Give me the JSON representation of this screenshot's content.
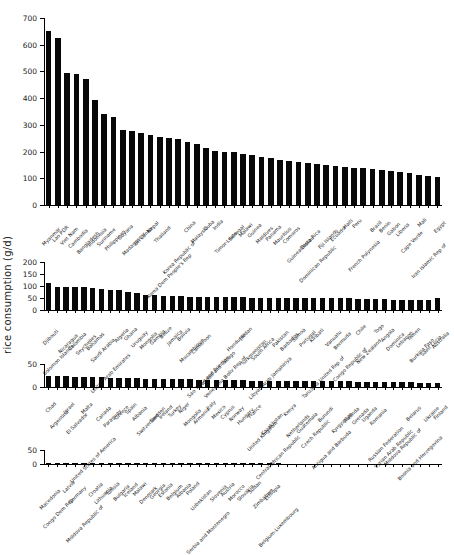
{
  "chart_data": {
    "type": "bar",
    "title": "",
    "xlabel": "",
    "ylabel": "rice consumption (g/d)",
    "grid": false,
    "legend": "none",
    "orientation": "vertical",
    "bar_color": "#080808",
    "note": "Four stacked panels, countries sorted descending by rice consumption (g/d)",
    "panels": [
      {
        "index": 1,
        "ylim": [
          0,
          700
        ],
        "yticks": [
          0,
          100,
          200,
          300,
          400,
          500,
          600,
          700
        ],
        "categories": [
          "Myanmar",
          "Lao PDR",
          "Viet Nam",
          "Cambodia",
          "Bangladesh",
          "Indonesia",
          "Suriname",
          "Philippines",
          "Guyana",
          "Madagascar",
          "Sri Lanka",
          "Nepal",
          "Thailand",
          "Korea Dem People's Rep",
          "Korea Republic of",
          "China",
          "Malaysia",
          "Cuba",
          "India",
          "Timor-Leste",
          "Senegal",
          "Malawi",
          "Guinea",
          "Maldives",
          "Panama",
          "Mauritius",
          "Comoros",
          "Guinea-Bissau",
          "Costa Rica",
          "Dominican Republic",
          "Fiji Islands",
          "Ecuador",
          "Haiti",
          "Peru",
          "French Polynesia",
          "Brazil",
          "Benin",
          "Gabon",
          "Liberia",
          "Cape Verde",
          "Mali",
          "Iran Islamic Rep of",
          "Egypt"
        ],
        "values": [
          650,
          625,
          495,
          492,
          470,
          393,
          340,
          328,
          280,
          278,
          269,
          262,
          253,
          251,
          246,
          236,
          227,
          212,
          203,
          198,
          198,
          190,
          186,
          180,
          176,
          170,
          166,
          162,
          158,
          154,
          150,
          147,
          143,
          140,
          137,
          133,
          130,
          126,
          122,
          118,
          113,
          107,
          103
        ]
      },
      {
        "index": 2,
        "ylim": [
          0,
          200
        ],
        "yticks": [
          0,
          50,
          100,
          150,
          200
        ],
        "categories": [
          "Djibouti",
          "Solomon Islands",
          "Nicaragua",
          "Colombia",
          "Seychelles",
          "Bahamas",
          "Saudi Arabia",
          "United Arab Emirates",
          "Algeria",
          "Ghana",
          "Uruguay",
          "Mongolia",
          "Gambia",
          "Belize",
          "Jamaica",
          "Bolivia",
          "Mozambique",
          "Cameroon",
          "Sao Tome and Principe",
          "Trinidad and Tobago",
          "Venezuela Boliv Rep of",
          "Honduras",
          "Jordan",
          "Turkmenistan",
          "South Africa",
          "Libyan Arab Jamahiriya",
          "Pakistan",
          "Barbados",
          "Samoa",
          "Portugal",
          "Kiribati",
          "Tanzania United Rep of",
          "Vanuatu",
          "Bermuda",
          "Congo Republic of",
          "Chile",
          "New Zealand",
          "Togo",
          "Angola",
          "Dominica",
          "Lebanon",
          "Yemen",
          "Burkina Faso",
          "Saint Lucia",
          "Australia"
        ],
        "values": [
          112,
          97,
          96,
          95,
          95,
          93,
          87,
          85,
          85,
          75,
          72,
          63,
          62,
          58,
          57,
          57,
          56,
          54,
          53,
          53,
          53,
          53,
          53,
          52,
          52,
          52,
          52,
          51,
          51,
          50,
          50,
          49,
          49,
          48,
          48,
          47,
          46,
          45,
          44,
          43,
          42,
          41,
          40,
          40,
          48
        ]
      },
      {
        "index": 3,
        "ylim": [
          0,
          50
        ],
        "yticks": [
          0,
          50
        ],
        "categories": [
          "Chad",
          "Argentina",
          "Israel",
          "El Salvador",
          "Malta",
          "United States of America",
          "Canada",
          "Paraguay",
          "Greece",
          "Spain",
          "Albania",
          "Switzerland",
          "Sweden",
          "Ireland",
          "Turkey",
          "Niger",
          "Mongolia",
          "Armenia",
          "Italy",
          "Mexico",
          "Cyprus",
          "Norway",
          "Hungary",
          "France",
          "United Kingdom",
          "Kazakhstan",
          "Central African Republic",
          "Kenya",
          "Netherlands",
          "Guatemala",
          "Czech Republic",
          "Burundi",
          "Antigua and Barbuda",
          "Kyrgyzstan",
          "Rwanda",
          "Grenada",
          "Uganda",
          "Romania",
          "Russian Federation",
          "Syrian Arab Republic",
          "Moldova Republic of",
          "Belarus",
          "Bosnia and Herzegovina",
          "Ukraine",
          "Finland"
        ],
        "values": [
          24,
          23,
          23,
          22,
          22,
          21,
          21,
          20,
          20,
          19,
          19,
          18,
          18,
          18,
          17,
          17,
          17,
          16,
          16,
          16,
          15,
          15,
          15,
          14,
          14,
          14,
          14,
          13,
          13,
          13,
          13,
          12,
          12,
          12,
          12,
          11,
          11,
          11,
          11,
          10,
          10,
          10,
          9,
          9,
          9
        ]
      },
      {
        "index": 4,
        "ylim": [
          0,
          50
        ],
        "yticks": [
          0,
          50
        ],
        "categories": [
          "Macedonia",
          "Congo Dem Rep",
          "Latvia",
          "Germany",
          "Moldova Republic of",
          "Croatia",
          "Lithuania",
          "Tunisia",
          "Bulgaria",
          "Iceland",
          "Malawi",
          "Denmark",
          "Georgia",
          "Estonia",
          "Belgium",
          "Albania",
          "Poland",
          "Uzbekistan",
          "Serbia and Montenegro",
          "Slovenia",
          "Austria",
          "Morocco",
          "Slovakia",
          "Sudan",
          "Zimbabwe",
          "Ethiopia",
          "Belgium-Luxembourg"
        ],
        "values": [
          4.5,
          4.3,
          4.1,
          4.0,
          3.9,
          3.8,
          3.6,
          3.5,
          3.4,
          3.2,
          3.1,
          3.0,
          2.9,
          2.8,
          2.7,
          2.6,
          2.5,
          2.4,
          2.3,
          2.1,
          2.0,
          1.8,
          1.6,
          1.4,
          1.1,
          0.8,
          0.5
        ]
      }
    ]
  },
  "axis": {
    "ylabel": "rice consumption (g/d)"
  }
}
